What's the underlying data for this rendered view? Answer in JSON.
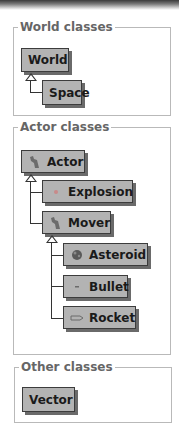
{
  "groups": {
    "world": {
      "legend": "World classes",
      "classes": [
        {
          "name": "World",
          "icon": null
        },
        {
          "name": "Space",
          "icon": null
        }
      ]
    },
    "actor": {
      "legend": "Actor classes",
      "classes": [
        {
          "name": "Actor",
          "icon": "footprint-icon"
        },
        {
          "name": "Explosion",
          "icon": "explosion-icon"
        },
        {
          "name": "Mover",
          "icon": "footprint-icon"
        },
        {
          "name": "Asteroid",
          "icon": "asteroid-icon"
        },
        {
          "name": "Bullet",
          "icon": "bullet-icon"
        },
        {
          "name": "Rocket",
          "icon": "rocket-icon"
        }
      ]
    },
    "other": {
      "legend": "Other classes",
      "classes": [
        {
          "name": "Vector",
          "icon": null
        }
      ]
    }
  },
  "colors": {
    "class_box_fill": "#b3b3b3",
    "class_box_border": "#3c3c3c",
    "group_border": "#b9b9b9",
    "legend_text": "#666666"
  }
}
